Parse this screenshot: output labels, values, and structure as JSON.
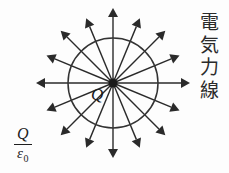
{
  "figure": {
    "title_label": "電気力線",
    "title_chars": [
      "電",
      "気",
      "力",
      "線"
    ],
    "charge_label": "Q",
    "flux_formula": {
      "numerator": "Q",
      "denominator_symbol": "ε",
      "denominator_subscript": "0",
      "full": "Q/ε0"
    },
    "colors": {
      "background": "#fdfdfd",
      "ink": "#1e1e1e",
      "ray": "#2a2a2a",
      "circle": "#333333"
    }
  },
  "chart_data": {
    "type": "scatter",
    "xlabel": "",
    "ylabel": "",
    "center": {
      "x": 113,
      "y": 83
    },
    "gaussian_circle_radius": 45,
    "charge_dot_radius": 4.5,
    "ray_count": 16,
    "ray_angle_step_deg": 22.5,
    "ray_length": 75,
    "ray_angles_deg": [
      0,
      22.5,
      45,
      67.5,
      90,
      112.5,
      135,
      157.5,
      180,
      202.5,
      225,
      247.5,
      270,
      292.5,
      315,
      337.5
    ],
    "ray_lengths": [
      77,
      72,
      74,
      70,
      75,
      70,
      74,
      72,
      77,
      72,
      74,
      70,
      75,
      70,
      74,
      72
    ],
    "arrowhead_length": 9,
    "arrowhead_width": 5,
    "annotations": [
      {
        "text": "Q",
        "x": 97,
        "y": 95,
        "role": "point-charge-label"
      },
      {
        "text": "電気力線",
        "x": 205,
        "y": 60,
        "role": "figure-title"
      },
      {
        "text": "Q/ε0",
        "x": 26,
        "y": 140,
        "role": "flux-formula"
      }
    ],
    "grid": false,
    "legend": null
  }
}
